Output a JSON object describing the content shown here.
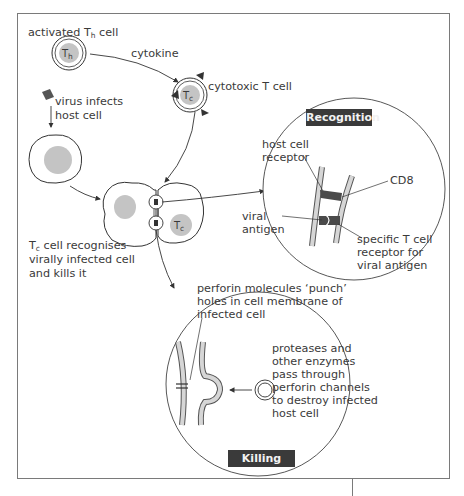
{
  "labels": {
    "activated_th_cell": {
      "prefix": "activated T",
      "sub": "h",
      "suffix": " cell"
    },
    "cytokine": "cytokine",
    "cytotoxic_t_cell": "cytotoxic T cell",
    "virus_infects": [
      "virus infects",
      "host cell"
    ],
    "tc_recognises": {
      "prefix": "T",
      "sub": "c",
      "lines": [
        " cell recognises",
        "virally infected cell",
        "and kills it"
      ]
    },
    "perforin": [
      "perforin molecules ‘punch’",
      "holes in cell membrane of",
      "infected cell"
    ],
    "proteases": [
      "proteases and",
      "other enzymes",
      "pass through",
      "perforin channels",
      "to destroy infected",
      "host cell"
    ]
  },
  "cells": {
    "th": {
      "main": "T",
      "sub": "h"
    },
    "tc_top": {
      "main": "T",
      "sub": "c"
    },
    "tc_bottom": {
      "main": "T",
      "sub": "c"
    }
  },
  "recognition": {
    "title": "Recognition",
    "host_cell_receptor": [
      "host cell",
      "receptor"
    ],
    "cd8": "CD8",
    "viral_antigen": [
      "viral",
      "antigen"
    ],
    "tcr": [
      "specific T cell",
      "receptor for",
      "viral antigen"
    ]
  },
  "killing": {
    "title": "Killing"
  },
  "colors": {
    "nucleus": "#c4c4c4",
    "membrane_fill": "#d6d6d6",
    "receptor_dark": "#4a4a4a",
    "badge_bg": "#3a3a3a",
    "line": "#3a3a3a",
    "frame": "#7a7a7a"
  }
}
